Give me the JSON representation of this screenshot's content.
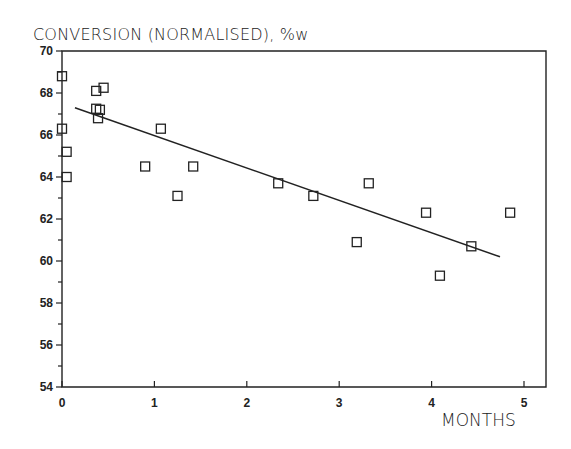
{
  "chart_data": {
    "type": "scatter",
    "title": "CONVERSION (NORMALISED), %w",
    "xlabel": "MONTHS",
    "ylabel": "CONVERSION (NORMALISED), %w",
    "xlim": [
      0,
      5.25
    ],
    "ylim": [
      54,
      70
    ],
    "x_ticks": [
      0,
      1,
      2,
      3,
      4,
      5
    ],
    "y_ticks": [
      54,
      56,
      58,
      60,
      62,
      64,
      66,
      68,
      70
    ],
    "grid": false,
    "legend": null,
    "marker": "open-square",
    "series": [
      {
        "name": "measurements",
        "points": [
          {
            "x": 0.0,
            "y": 68.8
          },
          {
            "x": 0.0,
            "y": 66.3
          },
          {
            "x": 0.05,
            "y": 65.2
          },
          {
            "x": 0.05,
            "y": 64.0
          },
          {
            "x": 0.37,
            "y": 68.1
          },
          {
            "x": 0.45,
            "y": 68.25
          },
          {
            "x": 0.37,
            "y": 67.25
          },
          {
            "x": 0.41,
            "y": 67.2
          },
          {
            "x": 0.39,
            "y": 66.8
          },
          {
            "x": 0.9,
            "y": 64.5
          },
          {
            "x": 1.07,
            "y": 66.3
          },
          {
            "x": 1.25,
            "y": 63.1
          },
          {
            "x": 1.42,
            "y": 64.5
          },
          {
            "x": 2.34,
            "y": 63.7
          },
          {
            "x": 2.72,
            "y": 63.1
          },
          {
            "x": 3.19,
            "y": 60.9
          },
          {
            "x": 3.32,
            "y": 63.7
          },
          {
            "x": 3.94,
            "y": 62.3
          },
          {
            "x": 4.09,
            "y": 59.3
          },
          {
            "x": 4.43,
            "y": 60.7
          },
          {
            "x": 4.85,
            "y": 62.3
          }
        ]
      }
    ],
    "trend_line": {
      "x0": 0.14,
      "y0": 67.3,
      "x1": 4.74,
      "y1": 60.2
    }
  },
  "labels": {
    "title": "CONVERSION (NORMALISED), %w",
    "xlabel": "MONTHS"
  }
}
